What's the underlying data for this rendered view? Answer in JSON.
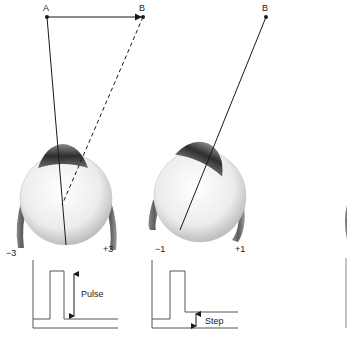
{
  "diagram": {
    "points": {
      "A": "A",
      "B_left": "B",
      "B_right": "B"
    },
    "left_panel": {
      "scale_minus": "−3",
      "scale_plus": "+3",
      "signal_label": "Pulse"
    },
    "right_panel": {
      "scale_minus": "−1",
      "scale_plus": "+1",
      "signal_label": "Step"
    },
    "colors": {
      "line": "#1a1a1a",
      "signal": "#555555",
      "eyeball": "#e8e8e8",
      "iris": "#3a3a3a",
      "muscle": "#6e6e6e"
    }
  }
}
